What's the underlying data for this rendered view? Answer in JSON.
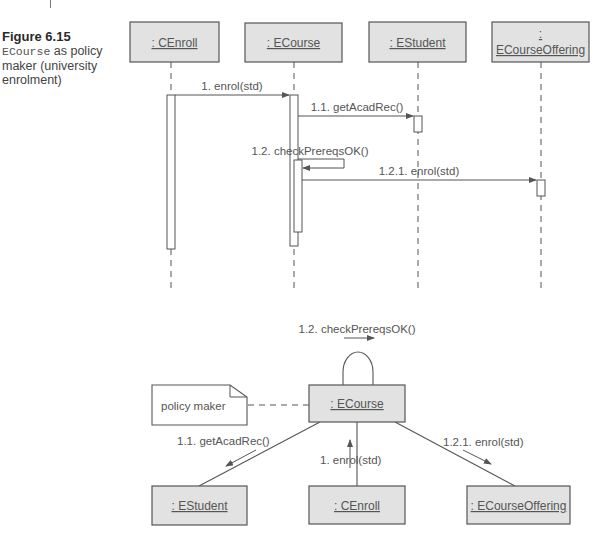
{
  "figure": {
    "number_label": "Figure 6.15",
    "class_name": "ECourse",
    "caption_rest": " as policy maker (university enrolment)"
  },
  "colors": {
    "box_fill": "#e2e2e2",
    "box_stroke": "#555555",
    "line": "#555555",
    "text": "#555555"
  },
  "sequence_diagram": {
    "lifelines": [
      {
        "id": "cenroll",
        "label": ": CEnroll"
      },
      {
        "id": "ecourse",
        "label": ": ECourse"
      },
      {
        "id": "estudent",
        "label": ": EStudent"
      },
      {
        "id": "ecourseoffering",
        "label_line1": ":",
        "label_line2": "ECourseOffering"
      }
    ],
    "messages": [
      {
        "id": "m1",
        "label": "1. enrol(std)",
        "from": "cenroll",
        "to": "ecourse"
      },
      {
        "id": "m11",
        "label": "1.1. getAcadRec()",
        "from": "ecourse",
        "to": "estudent"
      },
      {
        "id": "m12",
        "label": "1.2. checkPrereqsOK()",
        "from": "ecourse",
        "to": "ecourse"
      },
      {
        "id": "m121",
        "label": "1.2.1. enrol(std)",
        "from": "ecourse",
        "to": "ecourseoffering"
      }
    ]
  },
  "collaboration_diagram": {
    "objects": [
      {
        "id": "ecourse",
        "label": ": ECourse"
      },
      {
        "id": "estudent",
        "label": ": EStudent"
      },
      {
        "id": "cenroll",
        "label": ": CEnroll"
      },
      {
        "id": "ecourseoffering",
        "label": ": ECourseOffering"
      }
    ],
    "note": {
      "text": "policy maker"
    },
    "messages": [
      {
        "id": "c12",
        "label": "1.2. checkPrereqsOK()"
      },
      {
        "id": "c11",
        "label": "1.1. getAcadRec()"
      },
      {
        "id": "c1",
        "label": "1. enrol(std)"
      },
      {
        "id": "c121",
        "label": "1.2.1. enrol(std)"
      }
    ]
  }
}
